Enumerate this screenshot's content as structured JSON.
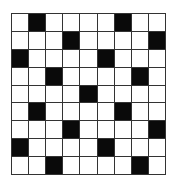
{
  "puzzle": {
    "rows": 9,
    "cols": 9,
    "black_cells": [
      [
        0,
        1
      ],
      [
        0,
        6
      ],
      [
        1,
        3
      ],
      [
        1,
        8
      ],
      [
        2,
        0
      ],
      [
        2,
        5
      ],
      [
        3,
        2
      ],
      [
        3,
        7
      ],
      [
        4,
        4
      ],
      [
        5,
        1
      ],
      [
        5,
        6
      ],
      [
        6,
        3
      ],
      [
        6,
        8
      ],
      [
        7,
        0
      ],
      [
        7,
        5
      ],
      [
        8,
        2
      ],
      [
        8,
        7
      ]
    ],
    "colors": {
      "black": "#0a0a0a",
      "white": "#ffffff",
      "line": "#333333"
    }
  }
}
